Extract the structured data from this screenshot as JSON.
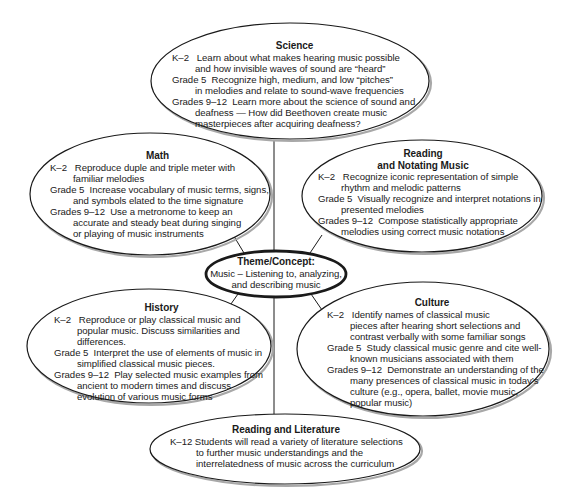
{
  "diagram": {
    "type": "concept-web",
    "center": {
      "title": "Theme/Concept:",
      "lines": [
        "Music – Listening to, analyzing,",
        "and describing music"
      ]
    },
    "nodes": {
      "science": {
        "title": "Science",
        "entries": [
          {
            "grade": "K–2",
            "lines": [
              "Learn about what makes hearing music possible",
              "and how invisible waves of sound are “heard”"
            ]
          },
          {
            "grade": "Grade 5",
            "lines": [
              "Recognize high, medium, and low “pitches”",
              "in melodies and relate to sound-wave frequencies"
            ]
          },
          {
            "grade": "Grades 9–12",
            "lines": [
              "Learn more about the science of sound and",
              "deafness — How did Beethoven create music",
              "masterpieces after acquiring deafness?"
            ]
          }
        ]
      },
      "math": {
        "title": "Math",
        "entries": [
          {
            "grade": "K–2",
            "lines": [
              "Reproduce duple and triple meter with",
              "familiar melodies"
            ]
          },
          {
            "grade": "Grade 5",
            "lines": [
              "Increase vocabulary of music terms, signs,",
              "and symbols elated to the time signature"
            ]
          },
          {
            "grade": "Grades 9–12",
            "lines": [
              "Use a metronome to keep an",
              "accurate and steady beat during singing",
              "or playing of music instruments"
            ]
          }
        ]
      },
      "reading_notating": {
        "title_line1": "Reading",
        "title_line2": "and Notating Music",
        "entries": [
          {
            "grade": "K–2",
            "lines": [
              "Recognize iconic representation of simple",
              "rhythm and melodic patterns"
            ]
          },
          {
            "grade": "Grade 5",
            "lines": [
              "Visually recognize and interpret notations in",
              "presented melodies"
            ]
          },
          {
            "grade": "Grades 9–12",
            "lines": [
              "Compose statistically appropriate",
              "melodies using correct music notations"
            ]
          }
        ]
      },
      "history": {
        "title": "History",
        "entries": [
          {
            "grade": "K–2",
            "lines": [
              "Reproduce or play classical music and",
              "popular music.  Discuss similarities and",
              "differences."
            ]
          },
          {
            "grade": "Grade 5",
            "lines": [
              "Interpret the use of elements of music in",
              "simplified classical music pieces."
            ]
          },
          {
            "grade": "Grades 9–12",
            "lines": [
              "Play selected music examples from",
              "ancient to modern times and discuss",
              "evolution of various music forms"
            ]
          }
        ]
      },
      "culture": {
        "title": "Culture",
        "entries": [
          {
            "grade": "K–2",
            "lines": [
              "Identify names of classical music",
              "pieces after hearing short selections and",
              "contrast verbally with some familiar songs"
            ]
          },
          {
            "grade": "Grade 5",
            "lines": [
              "Study classical music genre and cite well-",
              "known musicians associated with them"
            ]
          },
          {
            "grade": "Grades 9–12",
            "lines": [
              "Demonstrate an understanding of the",
              "many presences of classical music in today’s",
              "culture (e.g., opera, ballet, movie music,",
              "popular music)"
            ]
          }
        ]
      },
      "reading_literature": {
        "title": "Reading and Literature",
        "entries": [
          {
            "grade": "K–12",
            "lines": [
              "Students will read a variety of literature selections",
              "to further music understandings and the",
              "interrelatedness of music across the curriculum"
            ]
          }
        ]
      }
    },
    "colors": {
      "stroke": "#1a1a1a",
      "shadow": "#9a9a9a",
      "background": "#ffffff",
      "text": "#1a1a1a"
    }
  }
}
